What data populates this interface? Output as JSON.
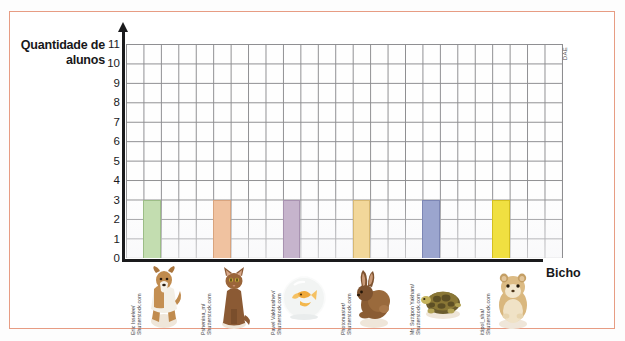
{
  "figure": {
    "y_axis_title": "Quantidade\nde alunos",
    "x_axis_title": "Bicho",
    "source_mark": "DAE",
    "border_color": "#e79c83"
  },
  "chart_data": {
    "type": "bar",
    "title": "",
    "xlabel": "Bicho",
    "ylabel": "Quantidade de alunos",
    "ylim": [
      0,
      11
    ],
    "ytick_labels": [
      "0",
      "1",
      "2",
      "3",
      "4",
      "5",
      "6",
      "7",
      "8",
      "9",
      "10",
      "11"
    ],
    "grid": true,
    "legend": "none",
    "categories": [
      "cachorro",
      "gato",
      "peixe",
      "coelho",
      "tartaruga",
      "hamster"
    ],
    "values": [
      3,
      3,
      3,
      3,
      3,
      3
    ],
    "bar_colors": [
      "#c3ddb0",
      "#f0c2a0",
      "#c6b4cc",
      "#f2d79a",
      "#9ba5ce",
      "#f0e041"
    ],
    "bar_border_colors": [
      "#9cbd86",
      "#d9a47e",
      "#a892b0",
      "#d7b873",
      "#7c86b4",
      "#d4c01f"
    ],
    "bar_grid_columns": [
      1,
      5,
      9,
      13,
      17,
      21
    ],
    "grid_columns": 25,
    "grid_rows": 11
  },
  "animals": [
    {
      "name": "cachorro",
      "icon": "dog-icon",
      "credit": "Eric Isselee/\nShutterstock.com",
      "bar_color": "#c3ddb0"
    },
    {
      "name": "gato",
      "icon": "cat-icon",
      "credit": "Pshenina_m/\nShutterstock.com",
      "bar_color": "#f0c2a0"
    },
    {
      "name": "peixe",
      "icon": "goldfish-bowl-icon",
      "credit": "Pavel Vakhrushev/\nShutterstock.com",
      "bar_color": "#c6b4cc"
    },
    {
      "name": "coelho",
      "icon": "rabbit-icon",
      "credit": "Photomaster/\nShutterstock.com",
      "bar_color": "#f2d79a"
    },
    {
      "name": "tartaruga",
      "icon": "turtle-icon",
      "credit": "Mr. Suttipon Yakham/\nShutterstock.com",
      "bar_color": "#9ba5ce"
    },
    {
      "name": "hamster",
      "icon": "hamster-icon",
      "credit": "ittipol_sha/\nShutterstock.com",
      "bar_color": "#f0e041"
    }
  ]
}
